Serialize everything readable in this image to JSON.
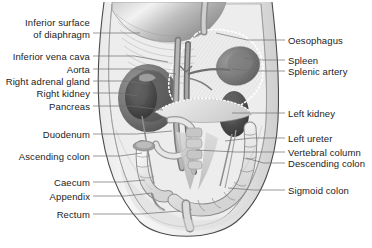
{
  "figure": {
    "background_color": "#ffffff",
    "leader_line_color": "#6e6e6e",
    "label_text_color": "#1b1b1b",
    "outline_color": "#4a4a4a"
  },
  "labels_left": [
    {
      "id": "inferior-surface-of-diaphragm",
      "line1": "Inferior surface",
      "line2": "of diaphragm",
      "text_x": 90,
      "text_y": 28,
      "leader_from_x": 93,
      "leader_from_y": 33,
      "leader_to_x": 140,
      "leader_to_y": 33
    },
    {
      "id": "inferior-vena-cava",
      "line1": "Inferior vena cava",
      "line2": "",
      "text_x": 90,
      "text_y": 56,
      "leader_from_x": 93,
      "leader_from_y": 56,
      "leader_to_x": 168,
      "leader_to_y": 62
    },
    {
      "id": "aorta",
      "line1": "Aorta",
      "line2": "",
      "text_x": 90,
      "text_y": 69,
      "leader_from_x": 93,
      "leader_from_y": 69,
      "leader_to_x": 176,
      "leader_to_y": 74
    },
    {
      "id": "right-adrenal-gland",
      "line1": "Right adrenal gland",
      "line2": "",
      "text_x": 90,
      "text_y": 81,
      "leader_from_x": 93,
      "leader_from_y": 81,
      "leader_to_x": 150,
      "leader_to_y": 84
    },
    {
      "id": "right-kidney",
      "line1": "Right kidney",
      "line2": "",
      "text_x": 90,
      "text_y": 93,
      "leader_from_x": 93,
      "leader_from_y": 93,
      "leader_to_x": 138,
      "leader_to_y": 96
    },
    {
      "id": "pancreas",
      "line1": "Pancreas",
      "line2": "",
      "text_x": 90,
      "text_y": 106,
      "leader_from_x": 93,
      "leader_from_y": 106,
      "leader_to_x": 163,
      "leader_to_y": 110
    },
    {
      "id": "duodenum",
      "line1": "Duodenum",
      "line2": "",
      "text_x": 90,
      "text_y": 134,
      "leader_from_x": 93,
      "leader_from_y": 134,
      "leader_to_x": 172,
      "leader_to_y": 131
    },
    {
      "id": "ascending-colon",
      "line1": "Ascending colon",
      "line2": "",
      "text_x": 90,
      "text_y": 156,
      "leader_from_x": 93,
      "leader_from_y": 156,
      "leader_to_x": 142,
      "leader_to_y": 153
    },
    {
      "id": "caecum",
      "line1": "Caecum",
      "line2": "",
      "text_x": 90,
      "text_y": 182,
      "leader_from_x": 93,
      "leader_from_y": 182,
      "leader_to_x": 145,
      "leader_to_y": 180
    },
    {
      "id": "appendix",
      "line1": "Appendix",
      "line2": "",
      "text_x": 90,
      "text_y": 196,
      "leader_from_x": 93,
      "leader_from_y": 196,
      "leader_to_x": 152,
      "leader_to_y": 193
    },
    {
      "id": "rectum",
      "line1": "Rectum",
      "line2": "",
      "text_x": 90,
      "text_y": 214,
      "leader_from_x": 93,
      "leader_from_y": 214,
      "leader_to_x": 180,
      "leader_to_y": 211
    }
  ],
  "labels_right": [
    {
      "id": "oesophagus",
      "line1": "Oesophagus",
      "line2": "",
      "text_x": 288,
      "text_y": 40,
      "leader_from_x": 285,
      "leader_from_y": 40,
      "leader_to_x": 216,
      "leader_to_y": 33
    },
    {
      "id": "spleen",
      "line1": "Spleen",
      "line2": "",
      "text_x": 288,
      "text_y": 60,
      "leader_from_x": 285,
      "leader_from_y": 60,
      "leader_to_x": 243,
      "leader_to_y": 58
    },
    {
      "id": "splenic-artery",
      "line1": "Splenic artery",
      "line2": "",
      "text_x": 288,
      "text_y": 71,
      "leader_from_x": 285,
      "leader_from_y": 71,
      "leader_to_x": 232,
      "leader_to_y": 69
    },
    {
      "id": "left-kidney",
      "line1": "Left kidney",
      "line2": "",
      "text_x": 288,
      "text_y": 113,
      "leader_from_x": 285,
      "leader_from_y": 113,
      "leader_to_x": 232,
      "leader_to_y": 113
    },
    {
      "id": "left-ureter",
      "line1": "Left ureter",
      "line2": "",
      "text_x": 288,
      "text_y": 138,
      "leader_from_x": 285,
      "leader_from_y": 138,
      "leader_to_x": 225,
      "leader_to_y": 141
    },
    {
      "id": "vertebral-column",
      "line1": "Vertebral column",
      "line2": "",
      "text_x": 288,
      "text_y": 152,
      "leader_from_x": 285,
      "leader_from_y": 152,
      "leader_to_x": 196,
      "leader_to_y": 150
    },
    {
      "id": "descending-colon",
      "line1": "Descending colon",
      "line2": "",
      "text_x": 288,
      "text_y": 163,
      "leader_from_x": 285,
      "leader_from_y": 163,
      "leader_to_x": 246,
      "leader_to_y": 158
    },
    {
      "id": "sigmoid-colon",
      "line1": "Sigmoid colon",
      "line2": "",
      "text_x": 288,
      "text_y": 190,
      "leader_from_x": 285,
      "leader_from_y": 190,
      "leader_to_x": 228,
      "leader_to_y": 188
    }
  ]
}
